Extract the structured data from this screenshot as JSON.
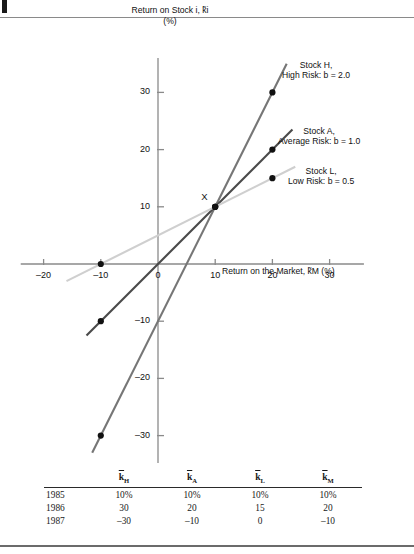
{
  "figure": {
    "y_axis_title_line1": "Return on Stock i, k̃i",
    "y_axis_title_line2": "(%)",
    "x_axis_title": "Return on the Market, k̃M (%)",
    "intersection_label": "X"
  },
  "series_labels": {
    "high": {
      "line1": "Stock H,",
      "line2": "High Risk: b = 2.0"
    },
    "average": {
      "line1": "Stock A,",
      "line2": "Average Risk: b = 1.0"
    },
    "low": {
      "line1": "Stock L,",
      "line2": "Low Risk: b = 0.5"
    }
  },
  "colors": {
    "high": "#767676",
    "average": "#4a4a4a",
    "low": "#cfcfcf",
    "axis": "#8a8a8a",
    "marker": "#111111"
  },
  "chart_data": {
    "type": "line",
    "title": "",
    "xlabel": "Return on the Market, k̃M (%)",
    "ylabel": "Return on Stock i, k̃i (%)",
    "xlim": [
      -24,
      36
    ],
    "ylim": [
      -36,
      36
    ],
    "xticks": [
      -20,
      -10,
      0,
      10,
      20,
      30
    ],
    "yticks": [
      -30,
      -20,
      -10,
      10,
      20,
      30
    ],
    "xtick_labels": [
      "–20",
      "–10",
      "0",
      "10",
      "20",
      "30"
    ],
    "ytick_labels": [
      "–30",
      "–20",
      "–10",
      "10",
      "20",
      "30"
    ],
    "grid": false,
    "legend": "inline-right",
    "annotations": [
      {
        "text": "X",
        "x": 10,
        "y": 10,
        "note": "common intersection point of all three lines"
      }
    ],
    "series": [
      {
        "name": "Stock H, High Risk: b = 2.0",
        "beta": 2.0,
        "color": "#767676",
        "points": [
          {
            "x": -10,
            "y": -30
          },
          {
            "x": 10,
            "y": 10
          },
          {
            "x": 20,
            "y": 30
          }
        ],
        "line_from": {
          "x": -11.5,
          "y": -33
        },
        "line_to": {
          "x": 22.5,
          "y": 35
        }
      },
      {
        "name": "Stock A, Average Risk: b = 1.0",
        "beta": 1.0,
        "color": "#4a4a4a",
        "points": [
          {
            "x": -10,
            "y": -10
          },
          {
            "x": 10,
            "y": 10
          },
          {
            "x": 20,
            "y": 20
          }
        ],
        "line_from": {
          "x": -12.5,
          "y": -12.5
        },
        "line_to": {
          "x": 23.5,
          "y": 23.5
        }
      },
      {
        "name": "Stock L, Low Risk: b = 0.5",
        "beta": 0.5,
        "color": "#cfcfcf",
        "points": [
          {
            "x": -10,
            "y": 0
          },
          {
            "x": 10,
            "y": 10
          },
          {
            "x": 20,
            "y": 15
          }
        ],
        "line_from": {
          "x": -16,
          "y": -3
        },
        "line_to": {
          "x": 24,
          "y": 17
        }
      }
    ]
  },
  "table": {
    "columns": [
      "",
      "k̃H",
      "k̃A",
      "k̃L",
      "k̃M"
    ],
    "column_subscripts": [
      "",
      "H",
      "A",
      "L",
      "M"
    ],
    "rows": [
      {
        "year": "1985",
        "kH": "10%",
        "kA": "10%",
        "kL": "10%",
        "kM": "10%"
      },
      {
        "year": "1986",
        "kH": "30",
        "kA": "20",
        "kL": "15",
        "kM": "20"
      },
      {
        "year": "1987",
        "kH": "–30",
        "kA": "–10",
        "kL": "0",
        "kM": "–10"
      }
    ]
  }
}
